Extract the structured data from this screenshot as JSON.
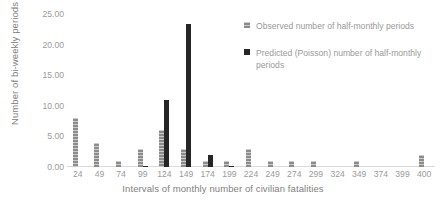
{
  "chart_data": {
    "type": "bar",
    "title": "",
    "xlabel": "Intervals of monthly number of civilian fatalities",
    "ylabel": "Number of bi-weekly periods",
    "categories": [
      "24",
      "49",
      "74",
      "99",
      "124",
      "149",
      "174",
      "199",
      "224",
      "249",
      "274",
      "299",
      "324",
      "349",
      "374",
      "399",
      "400"
    ],
    "ylim": [
      0,
      25
    ],
    "yticks": [
      "0.00",
      "5.00",
      "10.00",
      "15.00",
      "20.00",
      "25.00"
    ],
    "ytick_values": [
      0,
      5,
      10,
      15,
      20,
      25
    ],
    "grid": false,
    "legend_position": "top-right",
    "series": [
      {
        "name": "Observed number of half-monthly periods",
        "color": "#8c8c8c",
        "values": [
          8,
          4,
          1,
          3,
          6,
          3,
          1,
          1,
          3,
          1,
          1,
          1,
          0,
          1,
          0,
          0,
          2
        ]
      },
      {
        "name": "Predicted (Poisson) number of half-monthly periods",
        "color": "#262626",
        "values": [
          0,
          0,
          0,
          0.15,
          11,
          23.3,
          2,
          0.1,
          0,
          0,
          0,
          0,
          0,
          0,
          0,
          0,
          0
        ]
      }
    ]
  },
  "axes": {
    "y_title": "Number of bi-weekly periods",
    "x_title": "Intervals of monthly number of civilian fatalities"
  },
  "legend": {
    "items": [
      {
        "label": "Observed number of half-monthly periods",
        "marker": "square-swatch-observed"
      },
      {
        "label": "Predicted (Poisson) number of half-monthly periods",
        "marker": "square-swatch-predicted"
      }
    ]
  }
}
